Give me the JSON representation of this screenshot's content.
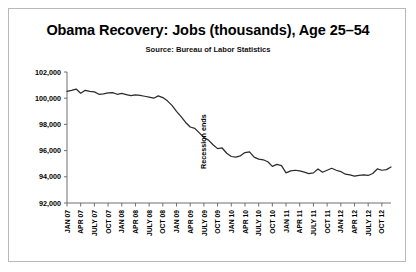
{
  "chart_data": {
    "type": "line",
    "title": "Obama Recovery: Jobs (thousands), Age 25–54",
    "subtitle": "Source: Bureau of Labor Statistics",
    "xlabel": "",
    "ylabel": "",
    "ylim": [
      92000,
      102000
    ],
    "yticks": [
      92000,
      94000,
      96000,
      98000,
      100000,
      102000
    ],
    "ytick_labels": [
      "92,000",
      "94,000",
      "96,000",
      "98,000",
      "100,000",
      "102,000"
    ],
    "grid": false,
    "legend": "none",
    "xtick_labels": [
      "JAN 07",
      "APR 07",
      "JULY 07",
      "OCT 07",
      "JAN 08",
      "APR 08",
      "JULY 08",
      "OCT 08",
      "JAN 09",
      "APR 09",
      "JULY 09",
      "OCT 09",
      "JAN 10",
      "APR 10",
      "JULY 10",
      "OCT 10",
      "JAN 11",
      "APR 11",
      "JULY 11",
      "OCT 11",
      "JAN 12",
      "APR 12",
      "JULY 12",
      "OCT 12"
    ],
    "annotations": [
      {
        "text": "Recession ends",
        "x": "JULY 09",
        "orientation": "vertical"
      }
    ],
    "series": [
      {
        "name": "Employment, Age 25–54 (thousands)",
        "x": [
          "JAN 07",
          "FEB 07",
          "MAR 07",
          "APR 07",
          "MAY 07",
          "JUN 07",
          "JULY 07",
          "AUG 07",
          "SEP 07",
          "OCT 07",
          "NOV 07",
          "DEC 07",
          "JAN 08",
          "FEB 08",
          "MAR 08",
          "APR 08",
          "MAY 08",
          "JUN 08",
          "JULY 08",
          "AUG 08",
          "SEP 08",
          "OCT 08",
          "NOV 08",
          "DEC 08",
          "JAN 09",
          "FEB 09",
          "MAR 09",
          "APR 09",
          "MAY 09",
          "JUN 09",
          "JULY 09",
          "AUG 09",
          "SEP 09",
          "OCT 09",
          "NOV 09",
          "DEC 09",
          "JAN 10",
          "FEB 10",
          "MAR 10",
          "APR 10",
          "MAY 10",
          "JUN 10",
          "JULY 10",
          "AUG 10",
          "SEP 10",
          "OCT 10",
          "NOV 10",
          "DEC 10",
          "JAN 11",
          "FEB 11",
          "MAR 11",
          "APR 11",
          "MAY 11",
          "JUN 11",
          "JULY 11",
          "AUG 11",
          "SEP 11",
          "OCT 11",
          "NOV 11",
          "DEC 11",
          "JAN 12",
          "FEB 12",
          "MAR 12",
          "APR 12",
          "MAY 12",
          "JUN 12",
          "JULY 12",
          "AUG 12",
          "SEP 12",
          "OCT 12",
          "NOV 12",
          "DEC 12"
        ],
        "values": [
          100520,
          100600,
          100700,
          100380,
          100600,
          100520,
          100480,
          100300,
          100330,
          100400,
          100420,
          100300,
          100360,
          100280,
          100200,
          100260,
          100220,
          100150,
          100080,
          100000,
          100180,
          100050,
          99800,
          99450,
          99000,
          98600,
          98150,
          97800,
          97700,
          97350,
          97000,
          96800,
          96450,
          96150,
          96200,
          95800,
          95550,
          95500,
          95600,
          95850,
          95900,
          95500,
          95350,
          95300,
          95150,
          94800,
          94950,
          94850,
          94300,
          94450,
          94500,
          94450,
          94350,
          94250,
          94300,
          94600,
          94350,
          94500,
          94650,
          94500,
          94400,
          94200,
          94150,
          94050,
          94100,
          94150,
          94100,
          94250,
          94600,
          94500,
          94550,
          94750
        ]
      }
    ]
  }
}
